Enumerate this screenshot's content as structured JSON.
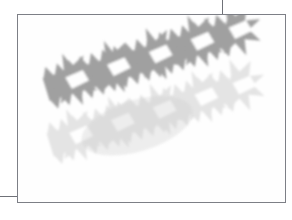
{
  "document": {
    "title": "Paper Cut-Out Star Chains",
    "background_color": "#ffffff"
  },
  "frame": {
    "name": "artwork-frame",
    "border_color": "#7d7f86",
    "fill_color": "#fefefe",
    "x": 17,
    "y": 14,
    "width": 269,
    "height": 189
  },
  "guides": [
    {
      "name": "top-vertical-crop-rule",
      "orientation": "vertical",
      "x": 222,
      "y": 0,
      "length": 15,
      "color": "#6f7178"
    },
    {
      "name": "left-horizontal-crop-rule",
      "orientation": "horizontal",
      "x": 0,
      "y": 196,
      "length": 18,
      "color": "#6f7178"
    }
  ],
  "artwork": {
    "description": "Two overlapping diagonal chains of connected paper-cut star shapes on a white ground",
    "shape_count": 2,
    "tilt_degrees": -17,
    "bands": [
      {
        "name": "upper-star-chain",
        "tone": "dark-gray",
        "fill_color": "#a0a0a0",
        "edge_color": "#8e8e8e",
        "opacity": 1,
        "star_points": 7,
        "offset_x": 0,
        "offset_y": 0
      },
      {
        "name": "lower-star-chain",
        "tone": "light-gray",
        "fill_color": "#e4e4e4",
        "edge_color": "#dcdcdc",
        "opacity": 1,
        "star_points": 7,
        "offset_x": 46,
        "offset_y": 74
      }
    ],
    "palette": {
      "darkest": "#8e8e8e",
      "mid": "#b4b4b4",
      "light": "#e4e4e4",
      "ground": "#fefefe"
    }
  }
}
